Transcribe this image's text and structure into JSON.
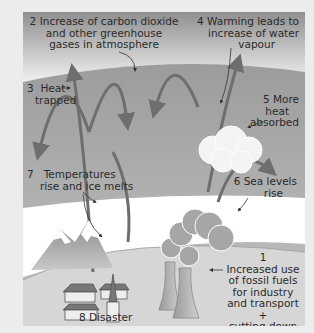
{
  "diagram": {
    "labels": [
      {
        "id": "co2",
        "number": "2",
        "lines": [
          "Increase of carbon dioxide",
          "and other greenhouse",
          "gases in atmosphere"
        ]
      },
      {
        "id": "heat-trapped",
        "number": "3",
        "lines": [
          "Heat",
          "trapped"
        ]
      },
      {
        "id": "water-vapour",
        "number": "4",
        "lines": [
          "Warming leads to",
          "increase of water",
          "vapour"
        ]
      },
      {
        "id": "more-heat",
        "number": "5",
        "lines": [
          "More",
          "heat",
          "absorbed"
        ]
      },
      {
        "id": "sea-levels",
        "number": "6",
        "lines": [
          "Sea levels",
          "rise"
        ]
      },
      {
        "id": "temperatures",
        "number": "7",
        "lines": [
          "Temperatures",
          "rise and ice melts"
        ]
      },
      {
        "id": "fossil-fuels",
        "number": "1",
        "lines": [
          "Increased use",
          "of fossil fuels",
          "for industry",
          "and transport",
          "+",
          "cutting down",
          "forests"
        ]
      },
      {
        "id": "disaster",
        "number": "8",
        "lines": [
          "Disaster"
        ]
      }
    ],
    "colors": {
      "sky_top": "#8f8f8f",
      "sky_bottom": "#ffffff",
      "atmosphere": "#a9a9a9",
      "sea": "#ffffff",
      "land": "#cfcfcf",
      "arrow": "#6e6e6e",
      "cloud": "#f4f4f4",
      "smoke": "#a6a6a6"
    }
  }
}
